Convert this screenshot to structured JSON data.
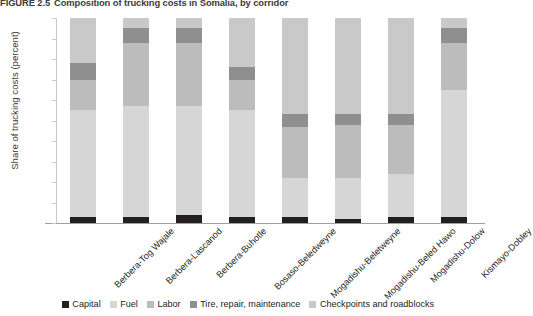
{
  "title": {
    "number": "FIGURE 2.5",
    "text": "Composition of trucking costs in Somalia, by corridor"
  },
  "axes": {
    "ylabel": "Share of trucking costs (percent)",
    "yticks": [
      "0",
      "10",
      "20",
      "30",
      "40",
      "50",
      "60",
      "70",
      "80",
      "90",
      "100"
    ],
    "xlabel": ""
  },
  "legend": {
    "items": [
      {
        "label": "Capital",
        "color": "#231f20"
      },
      {
        "label": "Fuel",
        "color": "#d6d6d6"
      },
      {
        "label": "Labor",
        "color": "#bcbcbc"
      },
      {
        "label": "Tire, repair, maintenance",
        "color": "#8f8f8f"
      },
      {
        "label": "Checkpoints and roadblocks",
        "color": "#c9c9c9"
      }
    ]
  },
  "chart_data": {
    "type": "bar",
    "stacked": true,
    "normalized_percent": true,
    "title": "Composition of trucking costs in Somalia, by corridor",
    "xlabel": "",
    "ylabel": "Share of trucking costs (percent)",
    "ylim": [
      0,
      100
    ],
    "ytick_step": 10,
    "grid": false,
    "legend_position": "bottom",
    "categories": [
      "Berbera-Tog Wajale",
      "Berbera-Lascanod",
      "Berbera-Buhotle",
      "Bosaso-Beledweyne",
      "Mogadishu-Beletweyne",
      "Mogadishu-Beled Hawo",
      "Mogadishu-Dolow",
      "Kismayo-Dobley"
    ],
    "series": [
      {
        "name": "Capital",
        "color": "#231f20",
        "values": [
          3,
          3,
          4,
          3,
          3,
          2,
          3,
          3
        ]
      },
      {
        "name": "Fuel",
        "color": "#d6d6d6",
        "values": [
          52,
          54,
          53,
          52,
          19,
          20,
          21,
          62
        ]
      },
      {
        "name": "Labor",
        "color": "#bcbcbc",
        "values": [
          15,
          31,
          31,
          15,
          25,
          26,
          24,
          23
        ]
      },
      {
        "name": "Tire, repair, maintenance",
        "color": "#8f8f8f",
        "values": [
          8,
          7,
          7,
          6,
          6,
          5,
          5,
          7
        ]
      },
      {
        "name": "Checkpoints and roadblocks",
        "color": "#c9c9c9",
        "values": [
          22,
          5,
          5,
          24,
          47,
          47,
          47,
          5
        ]
      }
    ]
  }
}
